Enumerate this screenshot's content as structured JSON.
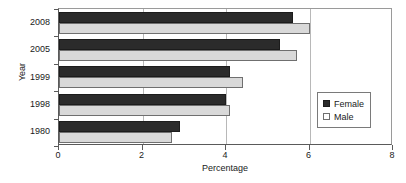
{
  "chart_data": {
    "type": "bar",
    "orientation": "horizontal",
    "title": "",
    "xlabel": "Percentage",
    "ylabel": "Year",
    "categories": [
      "2008",
      "2005",
      "1999",
      "1998",
      "1980"
    ],
    "series": [
      {
        "name": "Female",
        "color": "#2b2b2b",
        "values": [
          5.6,
          5.3,
          4.1,
          4.0,
          2.9
        ]
      },
      {
        "name": "Male",
        "color": "#d9d9d9",
        "values": [
          6.0,
          5.7,
          4.4,
          4.1,
          2.7
        ]
      }
    ],
    "xlim": [
      0,
      8
    ],
    "xticks": [
      0,
      2,
      4,
      6,
      8
    ],
    "xtick_labels": [
      "0",
      "2",
      "4",
      "6",
      "8"
    ],
    "grid": true,
    "grid_axis": "x",
    "legend_position": "center right",
    "legend_entries": [
      "Female",
      "Male"
    ]
  },
  "axes": {
    "x_title": "Percentage",
    "y_title": "Year"
  },
  "legend": {
    "female_label": "Female",
    "male_label": "Male"
  }
}
